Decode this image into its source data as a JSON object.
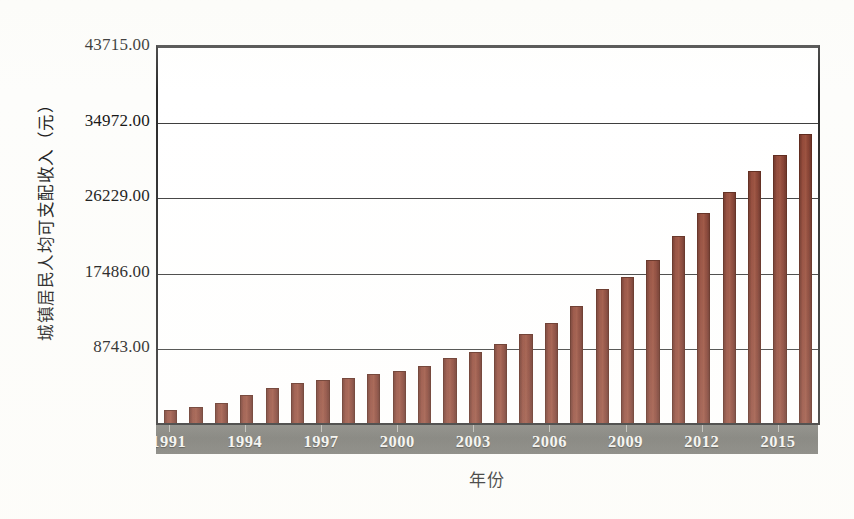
{
  "chart_data": {
    "type": "bar",
    "title": "",
    "xlabel": "年份",
    "ylabel": "城镇居民人均可支配收入（元）",
    "grid": true,
    "legend": false,
    "ylim": [
      0,
      43715
    ],
    "ytick_labels": [
      "8743.00",
      "17486.00",
      "26229.00",
      "34972.00",
      "43715.00"
    ],
    "ytick_values": [
      8743,
      17486,
      26229,
      34972,
      43715
    ],
    "xtick_labels": [
      "1991",
      "1994",
      "1997",
      "2000",
      "2003",
      "2006",
      "2009",
      "2012",
      "2015"
    ],
    "xtick_values": [
      1991,
      1994,
      1997,
      2000,
      2003,
      2006,
      2009,
      2012,
      2015
    ],
    "categories": [
      "1991",
      "1992",
      "1993",
      "1994",
      "1995",
      "1996",
      "1997",
      "1998",
      "1999",
      "2000",
      "2001",
      "2002",
      "2003",
      "2004",
      "2005",
      "2006",
      "2007",
      "2008",
      "2009",
      "2010",
      "2011",
      "2012",
      "2013",
      "2014",
      "2015",
      "2016"
    ],
    "values": [
      1700,
      2027,
      2577,
      3496,
      4283,
      4839,
      5160,
      5425,
      5854,
      6280,
      6860,
      7703,
      8472,
      9422,
      10493,
      11759,
      13786,
      15781,
      17175,
      19109,
      21810,
      24565,
      26955,
      29381,
      31195,
      33616
    ],
    "bar_color": "#8f4231",
    "bar_edge_color": "#5c2619",
    "axis_color": "#2a2a2a",
    "gridline_color": "#3c3c3c",
    "category_band_color": "#72726c",
    "category_label_color": "#f3f3ef",
    "plot_background": "#ffffff",
    "figure_background": "#fdfdfb"
  }
}
